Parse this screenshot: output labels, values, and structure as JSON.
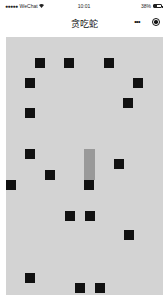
{
  "status_bar": {
    "carrier": "WeChat",
    "signal_dots": "●●●●●",
    "wifi_icon": "wifi",
    "time": "10:01",
    "battery_percent": "38%",
    "battery_level": 38
  },
  "nav_bar": {
    "title": "贪吃蛇",
    "more_icon": "•••",
    "close_icon": "target-circle"
  },
  "game": {
    "board": {
      "x": 6,
      "y": 37,
      "width": 157,
      "height": 258,
      "color": "#d3d3d3"
    },
    "block_color": "#111111",
    "snake_body_color": "#999999",
    "blocks": [
      {
        "x": 35,
        "y": 58
      },
      {
        "x": 64,
        "y": 58
      },
      {
        "x": 104,
        "y": 58
      },
      {
        "x": 25,
        "y": 78
      },
      {
        "x": 133,
        "y": 78
      },
      {
        "x": 123,
        "y": 98
      },
      {
        "x": 25,
        "y": 108
      },
      {
        "x": 25,
        "y": 149
      },
      {
        "x": 114,
        "y": 159
      },
      {
        "x": 45,
        "y": 170
      },
      {
        "x": 6,
        "y": 180
      },
      {
        "x": 65,
        "y": 211
      },
      {
        "x": 85,
        "y": 211
      },
      {
        "x": 124,
        "y": 230
      },
      {
        "x": 25,
        "y": 273
      },
      {
        "x": 75,
        "y": 283
      },
      {
        "x": 95,
        "y": 283
      }
    ],
    "snake": {
      "body": {
        "x": 84,
        "y": 149,
        "width": 11,
        "height": 31
      },
      "head": {
        "x": 84,
        "y": 180,
        "width": 10,
        "height": 10
      }
    }
  }
}
